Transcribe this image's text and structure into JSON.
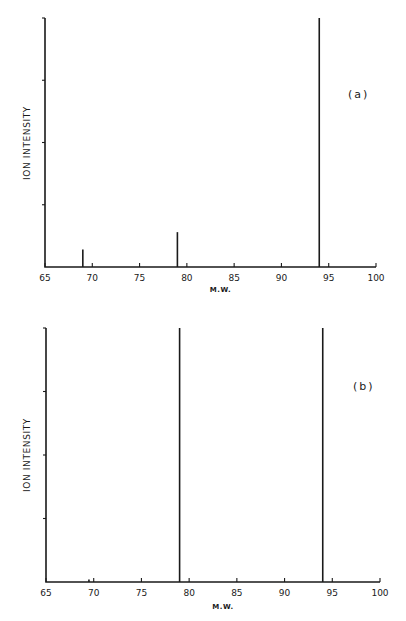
{
  "chart_data": [
    {
      "type": "bar",
      "panel_label": "(a)",
      "xlabel": "M.W.",
      "ylabel": "ION INTENSITY",
      "xlim": [
        65,
        100
      ],
      "xticks": [
        65,
        70,
        75,
        80,
        85,
        90,
        95,
        100
      ],
      "ylim": [
        0,
        100
      ],
      "y_tick_count": 4,
      "grid": false,
      "peaks": [
        {
          "x": 69,
          "y": 7
        },
        {
          "x": 79,
          "y": 14
        },
        {
          "x": 94,
          "y": 100
        }
      ]
    },
    {
      "type": "bar",
      "panel_label": "(b)",
      "xlabel": "M.W.",
      "ylabel": "ION INTENSITY",
      "xlim": [
        65,
        100
      ],
      "xticks": [
        65,
        70,
        75,
        80,
        85,
        90,
        95,
        100
      ],
      "ylim": [
        0,
        100
      ],
      "y_tick_count": 4,
      "grid": false,
      "peaks": [
        {
          "x": 69.5,
          "y": 1
        },
        {
          "x": 79,
          "y": 100
        },
        {
          "x": 94,
          "y": 100
        }
      ]
    }
  ],
  "labels": {
    "a": {
      "panel": "(a)",
      "xlabel": "M.W.",
      "ylabel": "ION INTENSITY",
      "ticks": [
        "65",
        "70",
        "75",
        "80",
        "85",
        "90",
        "95",
        "100"
      ]
    },
    "b": {
      "panel": "(b)",
      "xlabel": "M.W.",
      "ylabel": "ION INTENSITY",
      "ticks": [
        "65",
        "70",
        "75",
        "80",
        "85",
        "90",
        "95",
        "100"
      ]
    }
  }
}
